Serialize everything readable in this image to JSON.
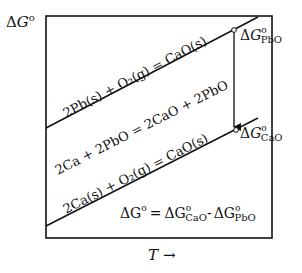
{
  "diagram": {
    "type": "Ellingham-style free energy diagram",
    "y_axis_label": {
      "delta": "Δ",
      "symbol": "G",
      "superscript": "o"
    },
    "x_axis_label": {
      "symbol": "T",
      "arrow": "→"
    },
    "reactions": {
      "upper": "2Pb(s) + O₂(g) = CaO(s)",
      "middle": "2Ca + 2PbO = 2CaO + 2PbO",
      "lower": "2Ca(s) + O₂(g) = CaO(s)"
    },
    "points": {
      "pbo": {
        "delta": "Δ",
        "symbol": "G",
        "sup": "o",
        "sub": "PbO"
      },
      "cao": {
        "delta": "Δ",
        "symbol": "G",
        "sup": "o",
        "sub": "CaO"
      }
    },
    "equation": {
      "lhs": "ΔG",
      "lhs_sup": "o",
      "eq": "=",
      "term1": "ΔG",
      "term1_sup": "o",
      "term1_sub": "CaO",
      "minus": "-",
      "term2": "ΔG",
      "term2_sup": "o",
      "term2_sub": "PbO"
    },
    "colors": {
      "line": "#111111",
      "background": "#ffffff"
    }
  }
}
